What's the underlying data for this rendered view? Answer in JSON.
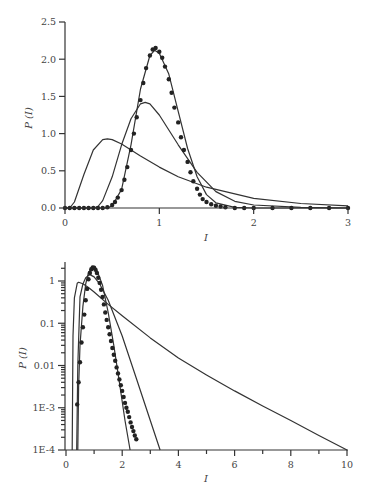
{
  "chart_data": [
    {
      "type": "line",
      "title": "",
      "xlabel": "I",
      "ylabel": "P (I)",
      "xlim": [
        0,
        3
      ],
      "ylim": [
        0,
        2.5
      ],
      "yscale": "linear",
      "xticks": [
        "0",
        "1",
        "2",
        "3"
      ],
      "yticks": [
        "0.0",
        "0.5",
        "1.0",
        "1.5",
        "2.0",
        "2.5"
      ],
      "grid": false,
      "legend": null,
      "series": [
        {
          "name": "curve-broad",
          "style": "line",
          "peak_x": 0.45,
          "peak_y": 0.93,
          "x": [
            0,
            0.05,
            0.1,
            0.2,
            0.3,
            0.4,
            0.45,
            0.5,
            0.6,
            0.8,
            1.0,
            1.2,
            1.5,
            2.0,
            2.5,
            3.0
          ],
          "y": [
            0,
            0.0,
            0.08,
            0.45,
            0.78,
            0.92,
            0.93,
            0.92,
            0.86,
            0.7,
            0.55,
            0.42,
            0.28,
            0.13,
            0.06,
            0.03
          ]
        },
        {
          "name": "curve-medium",
          "style": "line",
          "peak_x": 0.85,
          "peak_y": 1.42,
          "x": [
            0,
            0.3,
            0.35,
            0.4,
            0.5,
            0.6,
            0.7,
            0.8,
            0.85,
            0.9,
            1.0,
            1.2,
            1.4,
            1.6,
            1.8,
            2.0,
            2.5,
            3.0
          ],
          "y": [
            0,
            0.0,
            0.02,
            0.1,
            0.42,
            0.85,
            1.2,
            1.4,
            1.42,
            1.4,
            1.25,
            0.85,
            0.48,
            0.22,
            0.09,
            0.04,
            0.01,
            0.0
          ]
        },
        {
          "name": "curve-narrow",
          "style": "line",
          "peak_x": 0.95,
          "peak_y": 2.12,
          "x": [
            0,
            0.45,
            0.5,
            0.6,
            0.7,
            0.8,
            0.9,
            0.95,
            1.0,
            1.1,
            1.2,
            1.3,
            1.4,
            1.5,
            1.6,
            1.8,
            2.0,
            3.0
          ],
          "y": [
            0,
            0.0,
            0.03,
            0.25,
            0.85,
            1.6,
            2.05,
            2.12,
            2.08,
            1.8,
            1.3,
            0.8,
            0.42,
            0.18,
            0.07,
            0.01,
            0.0,
            0.0
          ]
        },
        {
          "name": "data-points",
          "style": "markers",
          "x": [
            0.0,
            0.05,
            0.1,
            0.15,
            0.2,
            0.25,
            0.3,
            0.35,
            0.4,
            0.45,
            0.5,
            0.53,
            0.56,
            0.6,
            0.63,
            0.66,
            0.7,
            0.73,
            0.76,
            0.8,
            0.83,
            0.86,
            0.9,
            0.93,
            0.96,
            1.0,
            1.03,
            1.06,
            1.1,
            1.13,
            1.16,
            1.2,
            1.23,
            1.26,
            1.3,
            1.33,
            1.36,
            1.4,
            1.43,
            1.46,
            1.5,
            1.55,
            1.6,
            1.65,
            1.7,
            1.8,
            1.9,
            2.0,
            2.2,
            2.4,
            2.6,
            2.8,
            3.0
          ],
          "y": [
            0,
            0,
            0,
            0,
            0,
            0,
            0,
            0,
            0,
            0.01,
            0.04,
            0.08,
            0.14,
            0.24,
            0.38,
            0.55,
            0.78,
            1.0,
            1.22,
            1.45,
            1.68,
            1.88,
            2.05,
            2.13,
            2.15,
            2.1,
            2.02,
            1.9,
            1.73,
            1.55,
            1.35,
            1.15,
            0.95,
            0.78,
            0.62,
            0.48,
            0.36,
            0.26,
            0.18,
            0.12,
            0.08,
            0.05,
            0.03,
            0.02,
            0.01,
            0.0,
            0.0,
            0.0,
            0.0,
            0.0,
            0.0,
            0.0,
            0.0
          ]
        }
      ]
    },
    {
      "type": "line",
      "title": "",
      "xlabel": "I",
      "ylabel": "P (I)",
      "xlim": [
        0,
        10
      ],
      "ylim": [
        0.0001,
        3
      ],
      "yscale": "log",
      "xticks": [
        "0",
        "2",
        "4",
        "6",
        "8",
        "10"
      ],
      "yticks": [
        "1E-4",
        "1E-3",
        "0.01",
        "0.1",
        "1"
      ],
      "grid": false,
      "legend": null,
      "series": [
        {
          "name": "curve-broad",
          "style": "line",
          "x": [
            0.22,
            0.25,
            0.3,
            0.4,
            0.45,
            0.6,
            0.8,
            1.0,
            1.5,
            2.0,
            3.0,
            4.0,
            5.0,
            6.0,
            7.0,
            8.0,
            9.0,
            10.0
          ],
          "y": [
            0.0001,
            0.05,
            0.4,
            0.88,
            0.93,
            0.86,
            0.7,
            0.55,
            0.28,
            0.15,
            0.045,
            0.015,
            0.006,
            0.0025,
            0.0011,
            0.0005,
            0.00022,
            0.0001
          ]
        },
        {
          "name": "curve-medium",
          "style": "line",
          "x": [
            0.38,
            0.42,
            0.5,
            0.6,
            0.7,
            0.85,
            1.0,
            1.2,
            1.5,
            2.0,
            2.5,
            3.0,
            3.35
          ],
          "y": [
            0.0001,
            0.01,
            0.42,
            0.85,
            1.2,
            1.42,
            1.25,
            0.85,
            0.35,
            0.05,
            0.005,
            0.0005,
            0.0001
          ]
        },
        {
          "name": "curve-narrow",
          "style": "line",
          "x": [
            0.42,
            0.45,
            0.5,
            0.6,
            0.7,
            0.8,
            0.95,
            1.1,
            1.3,
            1.5,
            1.7,
            1.9,
            2.1,
            2.28
          ],
          "y": [
            0.0001,
            0.003,
            0.03,
            0.25,
            0.85,
            1.6,
            2.12,
            1.8,
            0.8,
            0.18,
            0.03,
            0.004,
            0.0005,
            0.0001
          ]
        },
        {
          "name": "data-points",
          "style": "markers",
          "x": [
            0.4,
            0.45,
            0.5,
            0.55,
            0.6,
            0.65,
            0.7,
            0.75,
            0.8,
            0.85,
            0.9,
            0.95,
            1.0,
            1.05,
            1.1,
            1.15,
            1.2,
            1.25,
            1.3,
            1.35,
            1.4,
            1.45,
            1.5,
            1.55,
            1.6,
            1.65,
            1.7,
            1.75,
            1.8,
            1.85,
            1.9,
            1.95,
            2.0,
            2.05,
            2.1,
            2.15,
            2.2,
            2.25,
            2.3,
            2.35,
            2.4,
            2.45,
            2.5
          ],
          "y": [
            0.0012,
            0.004,
            0.012,
            0.035,
            0.08,
            0.16,
            0.35,
            0.65,
            1.1,
            1.55,
            1.9,
            2.1,
            2.05,
            1.85,
            1.55,
            1.2,
            0.9,
            0.62,
            0.42,
            0.28,
            0.18,
            0.12,
            0.08,
            0.055,
            0.038,
            0.026,
            0.018,
            0.013,
            0.009,
            0.0065,
            0.0047,
            0.0034,
            0.0025,
            0.0018,
            0.0013,
            0.001,
            0.0008,
            0.0006,
            0.00045,
            0.00035,
            0.00028,
            0.00022,
            0.00018
          ]
        }
      ]
    }
  ],
  "charts": {
    "top": {
      "ylabel": "P (I)",
      "xlabel": "I",
      "yticks": [
        "0.0",
        "0.5",
        "1.0",
        "1.5",
        "2.0",
        "2.5"
      ],
      "xticks": [
        "0",
        "1",
        "2",
        "3"
      ]
    },
    "bottom": {
      "ylabel": "P (I)",
      "xlabel": "I",
      "yticks": [
        "1E-4",
        "1E-3",
        "0.01",
        "0.1",
        "1"
      ],
      "xticks": [
        "0",
        "2",
        "4",
        "6",
        "8",
        "10"
      ]
    }
  },
  "colors": {
    "line": "#333333",
    "marker": "#222222",
    "text": "#444444",
    "background": "#ffffff"
  }
}
